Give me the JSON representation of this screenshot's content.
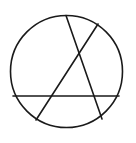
{
  "figure": {
    "name": "circle-with-three-inscribed-chords",
    "type": "geometric-line-drawing",
    "background_color": "#ffffff",
    "stroke_color": "#1a1a1a",
    "stroke_width": 1.6,
    "canvas": {
      "width": 136,
      "height": 143
    },
    "circle": {
      "label": "outer-circle",
      "center_x": 66.5,
      "center_y": 71.5,
      "radius": 56
    },
    "chords": [
      {
        "label": "chord-top-to-bottom-right",
        "x1": 66,
        "y1": 15.5,
        "x2": 102,
        "y2": 119
      },
      {
        "label": "chord-upper-right-to-bottom-left",
        "x1": 98,
        "y1": 24,
        "x2": 36,
        "y2": 120
      },
      {
        "label": "chord-horizontal",
        "x1": 13,
        "y1": 96,
        "x2": 119,
        "y2": 96
      }
    ]
  }
}
